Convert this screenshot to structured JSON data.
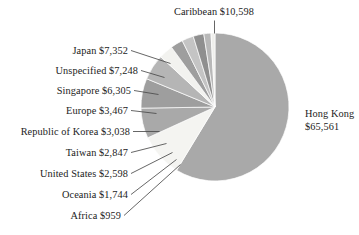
{
  "chart_data": {
    "type": "pie",
    "title": "",
    "subtitle": "",
    "xlabel": "",
    "ylabel": "",
    "legend_position": "none",
    "grid": false,
    "value_prefix": "$",
    "total": 111717,
    "categories": [
      "Hong Kong",
      "Caribbean",
      "Japan",
      "Unspecified",
      "Singapore",
      "Europe",
      "Republic of Korea",
      "Taiwan",
      "United States",
      "Oceania",
      "Africa"
    ],
    "values": [
      65561,
      10598,
      7352,
      7248,
      6305,
      3467,
      3038,
      2847,
      2598,
      1744,
      959
    ],
    "slices": [
      {
        "name": "Hong Kong",
        "value": 65561,
        "value_text": "$65,561",
        "label": "Hong Kong",
        "label_text": "Hong Kong $65,561",
        "color": "#a9a9a9",
        "pct": 58.7
      },
      {
        "name": "Caribbean",
        "value": 10598,
        "value_text": "$10,598",
        "label": "Caribbean",
        "label_text": "Caribbean $10,598",
        "color": "#f4f4f1",
        "pct": 9.5
      },
      {
        "name": "Japan",
        "value": 7352,
        "value_text": "$7,352",
        "label": "Japan",
        "label_text": "Japan $7,352",
        "color": "#a9a9a9",
        "pct": 6.6
      },
      {
        "name": "Unspecified",
        "value": 7248,
        "value_text": "$7,248",
        "label": "Unspecified",
        "label_text": "Unspecified $7,248",
        "color": "#9e9e9e",
        "pct": 6.5
      },
      {
        "name": "Singapore",
        "value": 6305,
        "value_text": "$6,305",
        "label": "Singapore",
        "label_text": "Singapore $6,305",
        "color": "#b5b5b5",
        "pct": 5.6
      },
      {
        "name": "Europe",
        "value": 3467,
        "value_text": "$3,467",
        "label": "Europe",
        "label_text": "Europe $3,467",
        "color": "#f2f2ef",
        "pct": 3.1
      },
      {
        "name": "Republic of Korea",
        "value": 3038,
        "value_text": "$3,038",
        "label": "Republic of Korea",
        "label_text": "Republic of Korea $3,038",
        "color": "#9e9e9e",
        "pct": 2.7
      },
      {
        "name": "Taiwan",
        "value": 2847,
        "value_text": "$2,847",
        "label": "Taiwan",
        "label_text": "Taiwan $2,847",
        "color": "#c4c4c4",
        "pct": 2.5
      },
      {
        "name": "United States",
        "value": 2598,
        "value_text": "$2,598",
        "label": "United States",
        "label_text": "United States $2,598",
        "color": "#8f8f8f",
        "pct": 2.3
      },
      {
        "name": "Oceania",
        "value": 1744,
        "value_text": "$1,744",
        "label": "Oceania",
        "label_text": "Oceania $1,744",
        "color": "#b8b8b8",
        "pct": 1.6
      },
      {
        "name": "Africa",
        "value": 959,
        "value_text": "$959",
        "label": "Africa",
        "label_text": "Africa $959",
        "color": "#efefec",
        "pct": 0.9
      }
    ]
  },
  "labels": {
    "caribbean": "Caribbean $10,598",
    "japan": "Japan $7,352",
    "unspecified": "Unspecified $7,248",
    "singapore": "Singapore $6,305",
    "europe": "Europe $3,467",
    "korea": "Republic of Korea $3,038",
    "taiwan": "Taiwan $2,847",
    "united_states": "United States $2,598",
    "oceania": "Oceania $1,744",
    "africa": "Africa $959",
    "hong_kong_line1": "Hong Kong",
    "hong_kong_line2": "$65,561"
  },
  "colors": {
    "background": "#ffffff",
    "text": "#1c1c1c",
    "leader_line": "#4a4a4a",
    "slice_gray": "#a9a9a9",
    "slice_white": "#f4f4f1"
  }
}
